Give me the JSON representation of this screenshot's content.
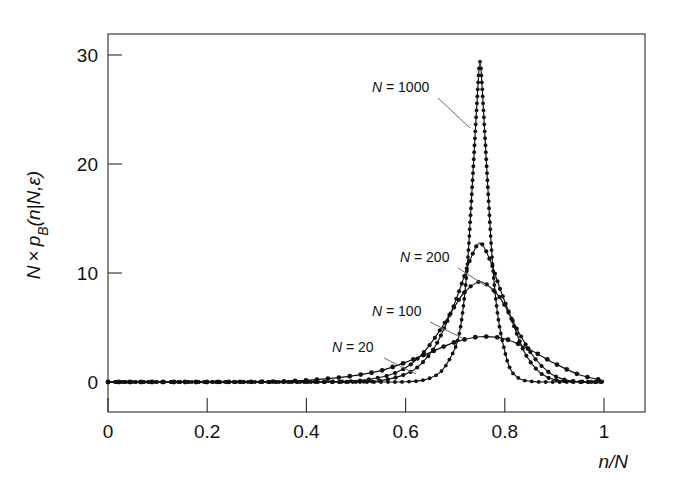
{
  "figure": {
    "background": "#ffffff",
    "ink_color": "#111111",
    "leader_color": "#6b6b6b"
  },
  "axes": {
    "x_title": "n/N",
    "y_title_parts": {
      "n": "N",
      "times": "×",
      "p": "p",
      "sub": "B",
      "arg": "(n|N,ε)"
    },
    "x_ticks": [
      "0",
      "0.2",
      "0.4",
      "0.6",
      "0.8",
      "1"
    ],
    "y_ticks": [
      "0",
      "10",
      "20",
      "30"
    ]
  },
  "annotations": [
    {
      "name": "annotation-n-1000",
      "var": "N",
      "eq": " = 1000",
      "text": "N = 1000",
      "x": 372,
      "y": 92,
      "leader": [
        [
          438,
          98
        ],
        [
          470,
          128
        ]
      ]
    },
    {
      "name": "annotation-n-200",
      "var": "N",
      "eq": " = 200",
      "text": "N = 200",
      "x": 400,
      "y": 262,
      "leader": [
        [
          458,
          268
        ],
        [
          486,
          286
        ]
      ]
    },
    {
      "name": "annotation-n-100",
      "var": "N",
      "eq": " = 100",
      "text": "N = 100",
      "x": 372,
      "y": 316,
      "leader": [
        [
          430,
          322
        ],
        [
          462,
          338
        ]
      ]
    },
    {
      "name": "annotation-n-20",
      "var": "N",
      "eq": " = 20",
      "text": "N = 20",
      "x": 332,
      "y": 352,
      "leader": [
        [
          384,
          358
        ],
        [
          416,
          374
        ]
      ]
    }
  ],
  "chart_data": {
    "type": "line",
    "title": "",
    "xlabel": "n/N",
    "ylabel": "N × p_B(n|N,ε)",
    "xlim": [
      0,
      1.08
    ],
    "ylim": [
      0,
      33
    ],
    "grid": false,
    "legend": "inline-annotations",
    "marker": "filled-circle",
    "peak_location": 0.75,
    "series": [
      {
        "name": "N = 20",
        "N": 20,
        "peak_value": 4.15,
        "x": [
          0.0,
          0.05,
          0.1,
          0.15,
          0.2,
          0.25,
          0.3,
          0.35,
          0.4,
          0.45,
          0.5,
          0.55,
          0.6,
          0.65,
          0.7,
          0.75,
          0.8,
          0.85,
          0.9,
          0.95,
          1.0
        ],
        "y": [
          0.0,
          0.0,
          0.0,
          0.0,
          0.0,
          0.01,
          0.02,
          0.06,
          0.15,
          0.33,
          0.61,
          1.04,
          1.8,
          2.72,
          3.66,
          4.15,
          3.96,
          2.99,
          1.72,
          0.67,
          0.12
        ]
      },
      {
        "name": "N = 100",
        "N": 100,
        "peak_value": 9.2,
        "x": [
          0.0,
          0.05,
          0.1,
          0.15,
          0.2,
          0.25,
          0.3,
          0.35,
          0.4,
          0.45,
          0.5,
          0.55,
          0.58,
          0.61,
          0.64,
          0.67,
          0.7,
          0.72,
          0.75,
          0.78,
          0.8,
          0.83,
          0.86,
          0.89,
          0.92,
          0.95,
          1.0
        ],
        "y": [
          0.0,
          0.0,
          0.0,
          0.0,
          0.0,
          0.0,
          0.0,
          0.0,
          0.01,
          0.03,
          0.1,
          0.44,
          0.85,
          1.6,
          2.9,
          4.8,
          7.0,
          8.3,
          9.2,
          8.3,
          7.0,
          4.4,
          2.2,
          0.85,
          0.22,
          0.04,
          0.0
        ]
      },
      {
        "name": "N = 200",
        "N": 200,
        "peak_value": 12.75,
        "x": [
          0.0,
          0.05,
          0.1,
          0.15,
          0.2,
          0.25,
          0.3,
          0.35,
          0.4,
          0.45,
          0.5,
          0.55,
          0.6,
          0.63,
          0.66,
          0.69,
          0.71,
          0.73,
          0.75,
          0.77,
          0.79,
          0.81,
          0.84,
          0.87,
          0.9,
          0.95,
          1.0
        ],
        "y": [
          0.0,
          0.0,
          0.0,
          0.0,
          0.0,
          0.0,
          0.0,
          0.0,
          0.0,
          0.0,
          0.02,
          0.12,
          0.72,
          1.6,
          3.3,
          6.2,
          8.6,
          11.2,
          12.75,
          11.2,
          8.6,
          6.2,
          2.7,
          0.9,
          0.22,
          0.01,
          0.0
        ]
      },
      {
        "name": "N = 1000",
        "N": 1000,
        "peak_value": 29.4,
        "x": [
          0.0,
          0.05,
          0.1,
          0.15,
          0.2,
          0.25,
          0.3,
          0.35,
          0.4,
          0.45,
          0.5,
          0.55,
          0.6,
          0.64,
          0.67,
          0.69,
          0.705,
          0.715,
          0.725,
          0.735,
          0.745,
          0.75,
          0.755,
          0.765,
          0.775,
          0.785,
          0.795,
          0.81,
          0.83,
          0.86,
          0.9,
          0.95,
          1.0
        ],
        "y": [
          0.0,
          0.0,
          0.0,
          0.0,
          0.0,
          0.0,
          0.0,
          0.0,
          0.0,
          0.0,
          0.0,
          0.0,
          0.02,
          0.22,
          0.9,
          2.2,
          3.8,
          6.4,
          11.0,
          18.5,
          26.5,
          29.4,
          26.5,
          18.5,
          11.0,
          6.4,
          3.8,
          1.3,
          0.3,
          0.03,
          0.0,
          0.0,
          0.0
        ]
      }
    ]
  }
}
